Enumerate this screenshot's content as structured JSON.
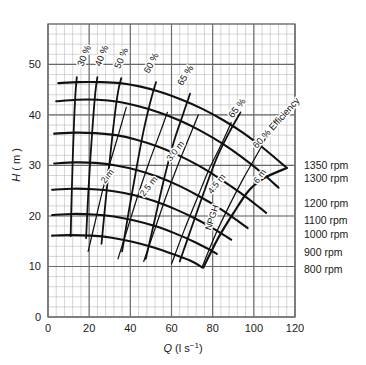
{
  "chart_data": {
    "type": "line",
    "title": "",
    "xlabel": "Q (l s⁻¹)",
    "ylabel": "H (m)",
    "xlim": [
      0,
      120
    ],
    "ylim": [
      0,
      58
    ],
    "grid": true,
    "x_ticks": [
      0,
      20,
      40,
      60,
      80,
      100,
      120
    ],
    "y_ticks": [
      0,
      10,
      20,
      30,
      40,
      50
    ],
    "x_major_step": 20,
    "y_major_step": 10,
    "x_minor_step": 4,
    "y_minor_step": 2,
    "legend_position": "right-outside",
    "series": [
      {
        "name": "1350 rpm",
        "label": "1350 rpm",
        "label_h": 30,
        "points": [
          [
            5,
            46.3
          ],
          [
            15,
            46.5
          ],
          [
            25,
            46.5
          ],
          [
            35,
            46.3
          ],
          [
            45,
            45.6
          ],
          [
            55,
            44.5
          ],
          [
            65,
            43.0
          ],
          [
            75,
            41.2
          ],
          [
            85,
            39.0
          ],
          [
            95,
            36.4
          ],
          [
            105,
            33.3
          ],
          [
            116,
            29.5
          ]
        ]
      },
      {
        "name": "1300 rpm",
        "label": "1300 rpm",
        "label_h": 27.5,
        "points": [
          [
            4,
            42.7
          ],
          [
            14,
            43.0
          ],
          [
            24,
            43.0
          ],
          [
            34,
            42.6
          ],
          [
            44,
            41.7
          ],
          [
            54,
            40.5
          ],
          [
            64,
            38.9
          ],
          [
            74,
            36.9
          ],
          [
            84,
            34.5
          ],
          [
            94,
            31.7
          ],
          [
            104,
            28.5
          ],
          [
            112,
            25.6
          ]
        ]
      },
      {
        "name": "1200 rpm",
        "label": "1200 rpm",
        "label_h": 22.5,
        "points": [
          [
            3,
            36.3
          ],
          [
            13,
            36.5
          ],
          [
            23,
            36.4
          ],
          [
            33,
            36.0
          ],
          [
            43,
            35.1
          ],
          [
            53,
            33.8
          ],
          [
            63,
            32.1
          ],
          [
            73,
            30.0
          ],
          [
            83,
            27.5
          ],
          [
            93,
            24.7
          ],
          [
            103,
            21.6
          ],
          [
            106,
            20.6
          ]
        ]
      },
      {
        "name": "1100 rpm",
        "label": "1100 rpm",
        "label_h": 19.3,
        "points": [
          [
            3,
            30.4
          ],
          [
            13,
            30.6
          ],
          [
            23,
            30.5
          ],
          [
            33,
            30.0
          ],
          [
            43,
            29.1
          ],
          [
            53,
            27.8
          ],
          [
            63,
            26.1
          ],
          [
            73,
            24.0
          ],
          [
            83,
            21.6
          ],
          [
            93,
            18.8
          ],
          [
            97,
            17.6
          ]
        ]
      },
      {
        "name": "1000 rpm",
        "label": "1000 rpm",
        "label_h": 16.5,
        "points": [
          [
            2,
            25.2
          ],
          [
            12,
            25.4
          ],
          [
            22,
            25.3
          ],
          [
            32,
            24.9
          ],
          [
            42,
            24.1
          ],
          [
            52,
            22.9
          ],
          [
            62,
            21.3
          ],
          [
            72,
            19.4
          ],
          [
            82,
            17.1
          ],
          [
            89,
            15.3
          ]
        ]
      },
      {
        "name": "900 rpm",
        "label": "900 rpm",
        "label_h": 12.8,
        "points": [
          [
            2,
            20.2
          ],
          [
            12,
            20.4
          ],
          [
            22,
            20.3
          ],
          [
            32,
            19.9
          ],
          [
            42,
            19.1
          ],
          [
            52,
            18.0
          ],
          [
            62,
            16.5
          ],
          [
            72,
            14.7
          ],
          [
            80,
            13.0
          ],
          [
            82,
            12.5
          ]
        ]
      },
      {
        "name": "800 rpm",
        "label": "800 rpm",
        "label_h": 9.6,
        "points": [
          [
            2,
            16.1
          ],
          [
            11,
            16.2
          ],
          [
            21,
            16.1
          ],
          [
            31,
            15.7
          ],
          [
            41,
            14.9
          ],
          [
            51,
            13.8
          ],
          [
            61,
            12.4
          ],
          [
            70,
            11.0
          ],
          [
            75,
            9.8
          ]
        ]
      }
    ],
    "efficiency_curves": [
      {
        "label": "30 %",
        "label_x": 19,
        "label_y": 51.5,
        "rotate": -68,
        "points": [
          [
            11,
            16.0
          ],
          [
            11.5,
            24.0
          ],
          [
            12.0,
            31.0
          ],
          [
            12.6,
            38.0
          ],
          [
            13.3,
            44.0
          ],
          [
            14.0,
            47.5
          ]
        ]
      },
      {
        "label": "40 %",
        "label_x": 27.5,
        "label_y": 51.5,
        "rotate": -68,
        "points": [
          [
            18.5,
            15.6
          ],
          [
            19.5,
            24.0
          ],
          [
            20.6,
            31.5
          ],
          [
            21.8,
            38.5
          ],
          [
            23.0,
            44.5
          ],
          [
            24.0,
            47.5
          ]
        ]
      },
      {
        "label": "50 %",
        "label_x": 37,
        "label_y": 51.0,
        "rotate": -66,
        "points": [
          [
            26.0,
            14.5
          ],
          [
            28.0,
            23.0
          ],
          [
            30.0,
            31.0
          ],
          [
            32.0,
            38.5
          ],
          [
            34.0,
            44.5
          ],
          [
            35.6,
            47.3
          ]
        ]
      },
      {
        "label": "60 %",
        "label_x": 51.5,
        "label_y": 50.0,
        "rotate": -62,
        "points": [
          [
            36.0,
            13.0
          ],
          [
            39.5,
            21.5
          ],
          [
            43.0,
            29.5
          ],
          [
            46.5,
            37.0
          ],
          [
            50.0,
            43.0
          ],
          [
            52.5,
            46.5
          ]
        ]
      },
      {
        "label": "65 %",
        "label_x": 68,
        "label_y": 47.5,
        "rotate": -58,
        "points": [
          [
            47.5,
            11.5
          ],
          [
            52.0,
            19.5
          ],
          [
            56.5,
            27.5
          ],
          [
            61.0,
            34.5
          ],
          [
            65.5,
            40.0
          ],
          [
            69.0,
            44.2
          ]
        ]
      },
      {
        "label": "65 %",
        "label_x": 93,
        "label_y": 41.0,
        "rotate": -52,
        "points": [
          [
            64.0,
            11.0
          ],
          [
            70.0,
            18.0
          ],
          [
            76.0,
            25.0
          ],
          [
            82.0,
            31.5
          ],
          [
            88.0,
            36.5
          ],
          [
            93.5,
            40.5
          ]
        ]
      },
      {
        "label": "60 % Efficiency",
        "label_x": 112,
        "label_y": 38.0,
        "rotate": -48,
        "points": [
          [
            75.5,
            9.8
          ],
          [
            82.5,
            15.5
          ],
          [
            90.0,
            20.5
          ],
          [
            97.5,
            25.0
          ],
          [
            105.0,
            27.5
          ],
          [
            116.0,
            29.5
          ]
        ]
      }
    ],
    "npsh_curves": [
      {
        "label": "2 m",
        "label_x": 30,
        "label_y": 27.5,
        "rotate": -52,
        "points": [
          [
            19.5,
            13.0
          ],
          [
            23.0,
            19.0
          ],
          [
            26.5,
            25.0
          ],
          [
            30.5,
            31.0
          ],
          [
            34.5,
            36.5
          ],
          [
            38.0,
            41.5
          ]
        ]
      },
      {
        "label": "2.5 m",
        "label_x": 50,
        "label_y": 25.5,
        "rotate": -52,
        "points": [
          [
            34.0,
            11.5
          ],
          [
            39.0,
            18.0
          ],
          [
            44.0,
            24.5
          ],
          [
            49.0,
            30.5
          ],
          [
            54.0,
            36.0
          ],
          [
            58.0,
            40.5
          ]
        ]
      },
      {
        "label": "3.0 m",
        "label_x": 63,
        "label_y": 32.5,
        "rotate": -52,
        "points": [
          [
            46.5,
            11.0
          ],
          [
            52.0,
            17.5
          ],
          [
            57.5,
            24.0
          ],
          [
            63.0,
            30.0
          ],
          [
            68.5,
            35.5
          ],
          [
            73.0,
            40.0
          ]
        ]
      },
      {
        "label": "4.5 m",
        "label_x": 83,
        "label_y": 26.0,
        "rotate": -52,
        "points": [
          [
            60.0,
            10.5
          ],
          [
            66.0,
            17.0
          ],
          [
            72.0,
            23.0
          ],
          [
            78.0,
            29.0
          ],
          [
            84.0,
            34.0
          ],
          [
            89.0,
            38.5
          ]
        ]
      },
      {
        "label": "6 m",
        "label_x": 104,
        "label_y": 27.5,
        "rotate": -52,
        "points": [
          [
            75.0,
            10.0
          ],
          [
            81.0,
            16.0
          ],
          [
            88.0,
            22.0
          ],
          [
            95.0,
            27.5
          ],
          [
            102.0,
            32.5
          ],
          [
            107.0,
            36.5
          ]
        ]
      },
      {
        "label": "NPGH",
        "label_x": 81,
        "label_y": 19.5,
        "rotate": -72,
        "points": []
      }
    ],
    "rpm_legend": [
      {
        "label": "1350 rpm"
      },
      {
        "label": "1300 rpm"
      },
      {
        "label": "1200 rpm"
      },
      {
        "label": "1100 rpm"
      },
      {
        "label": "1000 rpm"
      },
      {
        "label": "900 rpm"
      },
      {
        "label": "800 rpm"
      }
    ]
  },
  "axes": {
    "x_title": "Q (l s⁻¹)",
    "x_title_main": "Q",
    "x_title_unit": "(l s",
    "x_title_exp": "−1",
    "x_title_close": ")",
    "y_title": "H (m)",
    "y_title_main": "H",
    "y_title_unit": "( m )"
  },
  "colors": {
    "ink": "#1a1a1a",
    "grid_minor": "#b9b9b9",
    "grid_major": "#6a6a6a",
    "curve": "#111111"
  }
}
